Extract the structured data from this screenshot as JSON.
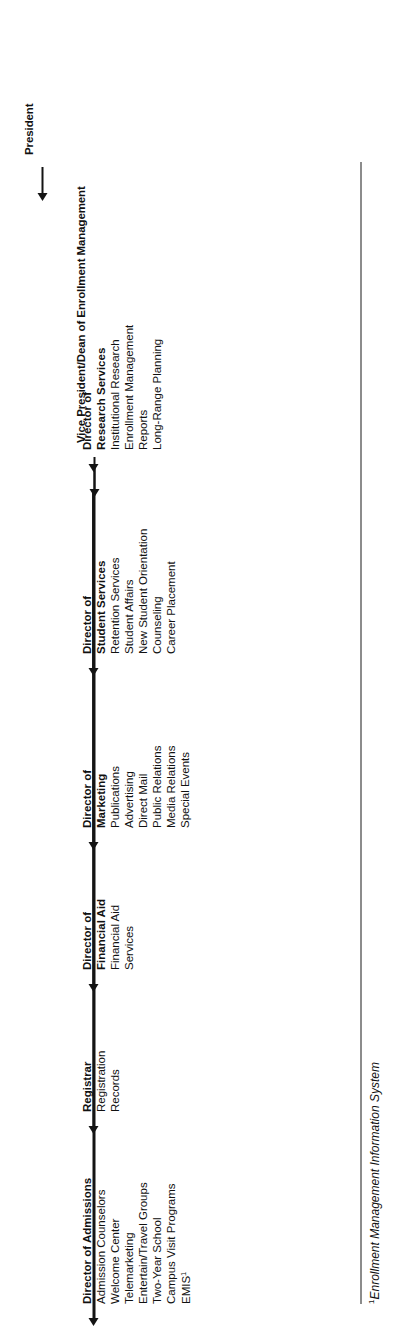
{
  "document": {
    "type": "organizational-chart",
    "orientation": "rotated-90-counterclockwise",
    "background_color": "#ffffff",
    "line_color": "#141414",
    "text_color": "#111111"
  },
  "top": {
    "president_label": "President",
    "vice_president_label": "Vice President/Dean of Enrollment Management"
  },
  "directors": [
    {
      "id": "admissions",
      "title_lines": [
        "Director of  Admissions"
      ],
      "duties": [
        "Admission Counselors",
        "Welcome Center",
        "Telemarketing",
        "Entertain/Travel Groups",
        "Two-Year School",
        "Campus Visit Programs",
        "EMIS"
      ],
      "duty_superscript_index": 6,
      "duty_superscript": "1"
    },
    {
      "id": "registrar",
      "title_lines": [
        "Registrar"
      ],
      "duties": [
        "Registration",
        "Records"
      ]
    },
    {
      "id": "financial-aid",
      "title_lines": [
        "Director of",
        "Financial Aid"
      ],
      "duties": [
        "Financial Aid",
        "Services"
      ]
    },
    {
      "id": "marketing",
      "title_lines": [
        "Director of",
        "Marketing"
      ],
      "duties": [
        "Publications",
        "Advertising",
        "Direct Mail",
        "Public Relations",
        "Media Relations",
        "Special Events"
      ]
    },
    {
      "id": "student-services",
      "title_lines": [
        "Director of",
        "Student Services"
      ],
      "duties": [
        "Retention Services",
        "Student Affairs",
        "New Student Orientation",
        "Counseling",
        "Career Placement"
      ]
    },
    {
      "id": "research-services",
      "title_lines": [
        "Director of",
        "Research Services"
      ],
      "duties": [
        "Institutional Research",
        "Enrollment Management",
        "Reports",
        "Long-Range Planning"
      ]
    }
  ],
  "footnote": {
    "marker": "1",
    "text": "Enrollment Management Information System"
  }
}
